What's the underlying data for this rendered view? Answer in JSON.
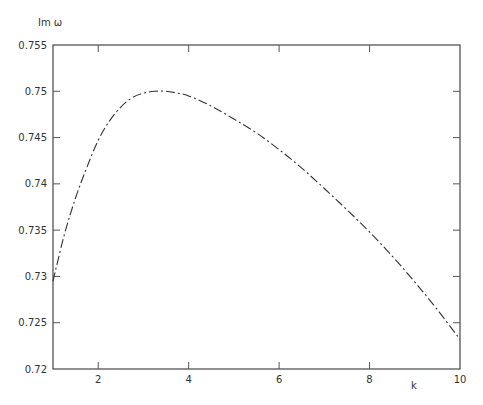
{
  "chart_data": {
    "type": "line",
    "title": "",
    "xlabel": "k",
    "ylabel": "Im ω",
    "xlim": [
      1,
      10
    ],
    "ylim": [
      0.72,
      0.755
    ],
    "grid": false,
    "legend": null,
    "x_ticks": [
      2,
      4,
      6,
      8,
      10
    ],
    "x_tick_labels": [
      "2",
      "4",
      "6",
      "8",
      "10"
    ],
    "y_ticks": [
      0.72,
      0.725,
      0.73,
      0.735,
      0.74,
      0.745,
      0.75,
      0.755
    ],
    "y_tick_labels": [
      "0.72",
      "0.725",
      "0.73",
      "0.735",
      "0.74",
      "0.745",
      "0.75",
      "0.755"
    ],
    "line_style": "dashed",
    "line_color": "#333333",
    "series": [
      {
        "name": "Im ω",
        "x": [
          1.0,
          1.25,
          1.5,
          1.75,
          2.0,
          2.25,
          2.5,
          2.75,
          3.0,
          3.25,
          3.5,
          3.75,
          4.0,
          4.5,
          5.0,
          5.5,
          6.0,
          6.5,
          7.0,
          7.5,
          8.0,
          8.5,
          9.0,
          9.5,
          10.0
        ],
        "values": [
          0.7295,
          0.7345,
          0.7385,
          0.7418,
          0.7447,
          0.7468,
          0.7483,
          0.7493,
          0.7498,
          0.75,
          0.75,
          0.7498,
          0.7495,
          0.7484,
          0.747,
          0.7455,
          0.7437,
          0.7417,
          0.7395,
          0.7372,
          0.7348,
          0.7322,
          0.7294,
          0.7264,
          0.7232
        ]
      }
    ]
  },
  "layout": {
    "plot_left": 53,
    "plot_top": 45,
    "plot_right": 460,
    "plot_bottom": 369
  }
}
